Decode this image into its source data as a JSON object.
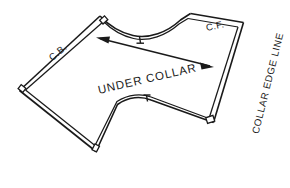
{
  "diagram": {
    "type": "sewing-pattern-draft",
    "background_color": "#ffffff",
    "line_color": "#1a1a1a"
  },
  "labels": {
    "center_back": "C.B.",
    "center_front": "C.F.",
    "piece_name": "UNDER COLLAR",
    "collar_edge": "COLLAR EDGE LINE"
  },
  "markings": {
    "grainline_name": "grainline-double-arrow",
    "neckline_notch": "neckline-notch",
    "bottom_notch": "bottom-edge-notch",
    "corner_notches": 4
  },
  "geometry": {
    "cut_line_points": "100,16 110,24 124,31 140,35 156,34 170,28 182,19 190,14 243,23 243,27 213,122 209,123 150,100 140,97 128,98 117,105 96,151 90,152 20,91 20,86",
    "seam_line_points": "103,22 112,29 125,35 140,39 155,38 169,32 181,23 188,19 238,27 238,31 209,118 205,119 150,96 139,93 127,94 115,101 95,145 91,146 26,90 26,87"
  }
}
